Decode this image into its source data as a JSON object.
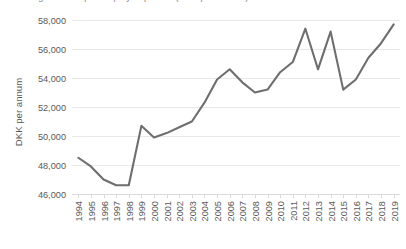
{
  "title_sliver": "Average income per employed person (DKK per annum)",
  "chart_data": {
    "type": "line",
    "title": "",
    "xlabel": "",
    "ylabel": "DKK per annum",
    "categories": [
      "1994",
      "1995",
      "1996",
      "1997",
      "1998",
      "1999",
      "2000",
      "2001",
      "2002",
      "2003",
      "2004",
      "2005",
      "2006",
      "2007",
      "2008",
      "2009",
      "2010",
      "2011",
      "2012",
      "2013",
      "2014",
      "2015",
      "2016",
      "2017",
      "2018",
      "2019"
    ],
    "values": [
      48500,
      47900,
      47000,
      46600,
      46600,
      50700,
      49900,
      50200,
      50600,
      51000,
      52300,
      53900,
      54600,
      53700,
      53000,
      53200,
      54400,
      55100,
      57400,
      54600,
      57200,
      53200,
      53900,
      55400,
      56400,
      57700
    ],
    "series": [
      {
        "name": "DKK per annum",
        "color": "#6e6e6e",
        "values": [
          48500,
          47900,
          47000,
          46600,
          46600,
          50700,
          49900,
          50200,
          50600,
          51000,
          52300,
          53900,
          54600,
          53700,
          53000,
          53200,
          54400,
          55100,
          57400,
          54600,
          57200,
          53200,
          53900,
          55400,
          56400,
          57700
        ]
      }
    ],
    "ylim": [
      46000,
      58000
    ],
    "yticks": [
      46000,
      48000,
      50000,
      52000,
      54000,
      56000,
      58000
    ],
    "ytick_labels": [
      "46,000",
      "48,000",
      "50,000",
      "52,000",
      "54,000",
      "56,000",
      "58,000"
    ],
    "grid": true,
    "grid_axis": "y",
    "legend": false,
    "legend_position": "none",
    "xtick_rotation": 90,
    "colors": {
      "line": "#6e6e6e",
      "grid": "#e8e8e8",
      "axis": "#d9d9d9",
      "text": "#595959",
      "background": "#ffffff"
    }
  }
}
